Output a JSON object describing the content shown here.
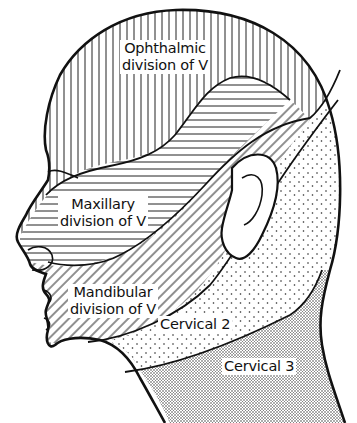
{
  "figure": {
    "type": "dermatome-head-illustration",
    "regions": [
      {
        "id": "ophthalmic",
        "lines": [
          "Ophthalmic",
          "division of V"
        ],
        "pattern": "vertical-hatch"
      },
      {
        "id": "maxillary",
        "lines": [
          "Maxillary",
          "division of V"
        ],
        "pattern": "horizontal-hatch"
      },
      {
        "id": "mandibular",
        "lines": [
          "Mandibular",
          "division of V"
        ],
        "pattern": "diagonal-hatch"
      },
      {
        "id": "cervical2",
        "lines": [
          "Cervical 2"
        ],
        "pattern": "sparse-dots"
      },
      {
        "id": "cervical3",
        "lines": [
          "Cervical 3"
        ],
        "pattern": "dense-dots"
      }
    ],
    "colors": {
      "ink": "#111111",
      "paper": "#ffffff"
    }
  }
}
